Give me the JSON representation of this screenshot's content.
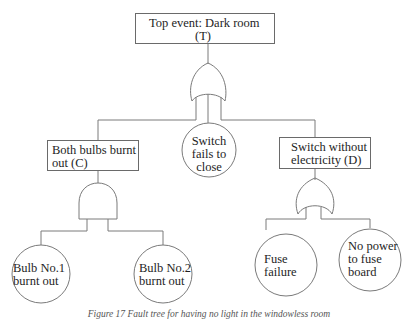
{
  "diagram": {
    "type": "fault-tree",
    "top_event": {
      "line1": "Top event: Dark room",
      "line2": "(T)"
    },
    "top_gate": "OR",
    "level1": {
      "left": {
        "line1": "Both bulbs burnt out",
        "line2": "out (C)",
        "text": "Both bulbs burnt out (C)",
        "gate": "AND"
      },
      "middle": {
        "line1": "Switch",
        "line2": "fails to",
        "line3": "close",
        "type": "basic-event"
      },
      "right": {
        "line1": "Switch without",
        "line2": "electricity (D)",
        "gate": "OR"
      }
    },
    "level2": {
      "bulb1": {
        "line1": "Bulb No.1",
        "line2": "burnt out"
      },
      "bulb2": {
        "line1": "Bulb No.2",
        "line2": "burnt out"
      },
      "fuse": {
        "line1": "Fuse",
        "line2": "failure"
      },
      "nopower": {
        "line1": "No power",
        "line2": "to fuse",
        "line3": "board"
      }
    },
    "caption": "Figure 17 Fault tree for having no light in the windowless room"
  },
  "colors": {
    "line": "#7a7a7a",
    "text": "#1e1e1e",
    "background": "#ffffff"
  }
}
